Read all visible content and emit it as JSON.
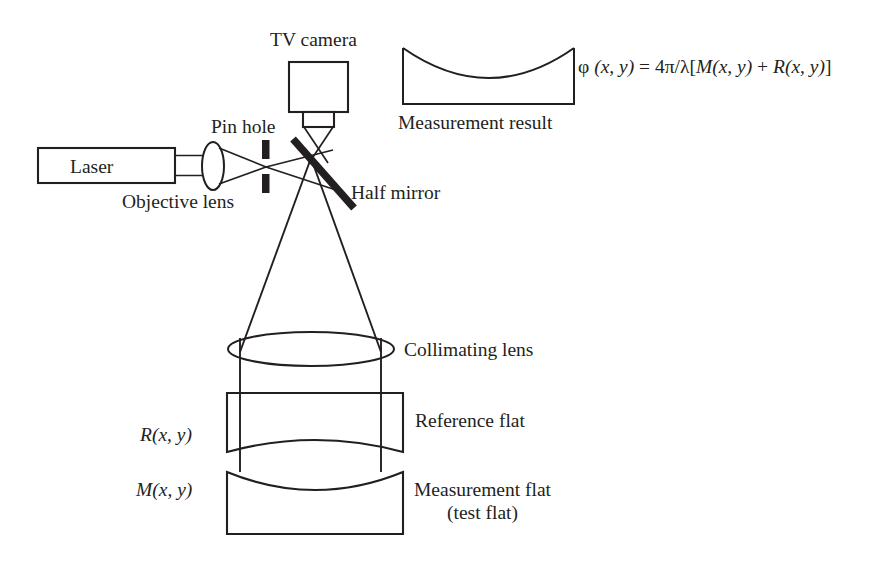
{
  "figure": {
    "type": "optical-interferometer-schematic",
    "title_visible": false,
    "background_color": "#ffffff",
    "line_color": "#231f20"
  },
  "labels": {
    "tv_camera": "TV camera",
    "pin_hole": "Pin hole",
    "laser": "Laser",
    "objective_lens": "Objective lens",
    "half_mirror": "Half mirror",
    "measurement_result": "Measurement result",
    "collimating_lens": "Collimating lens",
    "reference_flat": "Reference flat",
    "measurement_flat_line1": "Measurement flat",
    "measurement_flat_line2": "(test flat)",
    "reference_wavefront": "R(x, y)",
    "measurement_wavefront": "M(x, y)"
  },
  "formula": {
    "phi": "φ",
    "args": "(x, y)",
    "equals": "=",
    "coefficient": "4π/λ",
    "bracket_open": "[",
    "term_m": "M",
    "term_m_args": "(x, y)",
    "plus": "+",
    "term_r": "R",
    "term_r_args": "(x, y)",
    "bracket_close": "]",
    "full_text": "φ (x, y) = 4π/λ[M(x, y) + R(x, y)]"
  },
  "components": [
    {
      "name": "laser",
      "shape": "rectangle",
      "label": "Laser"
    },
    {
      "name": "objective-lens",
      "shape": "ellipse",
      "label": "Objective lens"
    },
    {
      "name": "pin-hole",
      "shape": "two-vertical-bars",
      "label": "Pin hole"
    },
    {
      "name": "half-mirror",
      "shape": "thick-diagonal-line",
      "label": "Half mirror"
    },
    {
      "name": "tv-camera",
      "shape": "rectangle-with-barrel",
      "label": "TV camera"
    },
    {
      "name": "collimating-lens",
      "shape": "wide-ellipse",
      "label": "Collimating lens"
    },
    {
      "name": "reference-flat",
      "shape": "plate-convex-bottom",
      "label": "Reference flat"
    },
    {
      "name": "measurement-flat",
      "shape": "plate-concave-top",
      "label": "Measurement flat"
    },
    {
      "name": "measurement-result-plot",
      "shape": "box-with-concave-curve",
      "label": "Measurement result"
    }
  ]
}
